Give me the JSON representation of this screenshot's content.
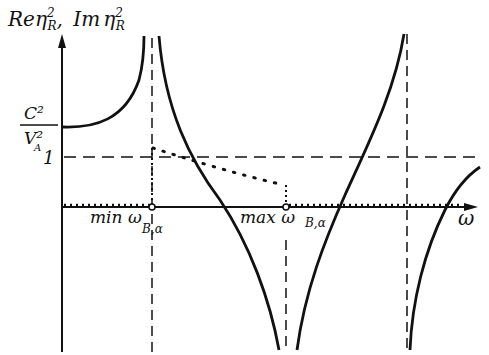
{
  "diagram": {
    "y_axis_label": "Re η²_R , Im η²_R",
    "y_label_parts": {
      "re": "Re",
      "sep": ",",
      "im": "Im",
      "eta": "η",
      "sub": "R",
      "sup": "2"
    },
    "x_axis_label": "ω",
    "tick_c2va2": {
      "num": "C²",
      "den": "V²",
      "den_sub": "A"
    },
    "tick_one": "1",
    "min_label": "min ω",
    "max_label": "max ω",
    "bd_sub": "B,α",
    "colors": {
      "ink": "#111111",
      "background": "#ffffff"
    }
  }
}
